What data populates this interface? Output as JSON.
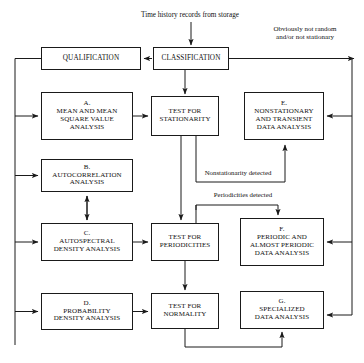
{
  "diagram": {
    "title_caption": "Time history records from storage",
    "nodes": [
      {
        "id": "qualification",
        "label": "QUALIFICATION",
        "x": 41,
        "y": 47,
        "w": 100,
        "h": 23,
        "fs": 7.2
      },
      {
        "id": "classification",
        "label": "CLASSIFICATION",
        "x": 153,
        "y": 47,
        "w": 76,
        "h": 23,
        "fs": 7.2
      },
      {
        "id": "box-a",
        "label": "A.\nMEAN AND MEAN\nSQUARE VALUE\nANALYSIS",
        "x": 41,
        "y": 92,
        "w": 92,
        "h": 48,
        "fs": 7.0
      },
      {
        "id": "box-b",
        "label": "B.\nAUTOCORRELATION\nANALYSIS",
        "x": 41,
        "y": 159,
        "w": 92,
        "h": 33,
        "fs": 7.0
      },
      {
        "id": "box-c",
        "label": "C.\nAUTOSPECTRAL\nDENSITY ANALYSIS",
        "x": 41,
        "y": 223,
        "w": 92,
        "h": 38,
        "fs": 7.0
      },
      {
        "id": "box-d",
        "label": "D.\nPROBABILITY\nDENSITY ANALYSIS",
        "x": 41,
        "y": 293,
        "w": 92,
        "h": 37,
        "fs": 7.0
      },
      {
        "id": "test-stat",
        "label": "TEST FOR\nSTATIONARITY",
        "x": 151,
        "y": 96,
        "w": 68,
        "h": 40,
        "fs": 7.0
      },
      {
        "id": "test-period",
        "label": "TEST FOR\nPERIODICITIES",
        "x": 151,
        "y": 223,
        "w": 68,
        "h": 38,
        "fs": 7.0
      },
      {
        "id": "test-normal",
        "label": "TEST FOR\nNORMALITY",
        "x": 151,
        "y": 293,
        "w": 68,
        "h": 36,
        "fs": 7.0
      },
      {
        "id": "box-e",
        "label": "E.\nNONSTATIONARY\nAND TRANSIENT\nDATA ANALYSIS",
        "x": 244,
        "y": 92,
        "w": 80,
        "h": 48,
        "fs": 7.0
      },
      {
        "id": "box-f",
        "label": "F.\nPERIODIC AND\nALMOST PERIODIC\nDATA ANALYSIS",
        "x": 240,
        "y": 218,
        "w": 84,
        "h": 48,
        "fs": 7.0
      },
      {
        "id": "box-g",
        "label": "G.\nSPECIALIZED\nDATA ANALYSIS",
        "x": 240,
        "y": 291,
        "w": 84,
        "h": 38,
        "fs": 7.0
      }
    ],
    "edge_labels": [
      {
        "id": "label-not-random",
        "text": "Obviously not random\nand/or not stationary",
        "x": 253,
        "y": 26,
        "w": 104,
        "fs": 7.0
      },
      {
        "id": "label-nonstationary",
        "text": "Nonstationarity detected",
        "x": 186,
        "y": 169,
        "w": 104,
        "fs": 6.8
      },
      {
        "id": "label-periodicities",
        "text": "Periodicities detected",
        "x": 193,
        "y": 192,
        "w": 100,
        "fs": 6.8
      }
    ],
    "colors": {
      "ink": "#101010",
      "line": "#1a1a1a",
      "background": "#ffffff"
    }
  }
}
